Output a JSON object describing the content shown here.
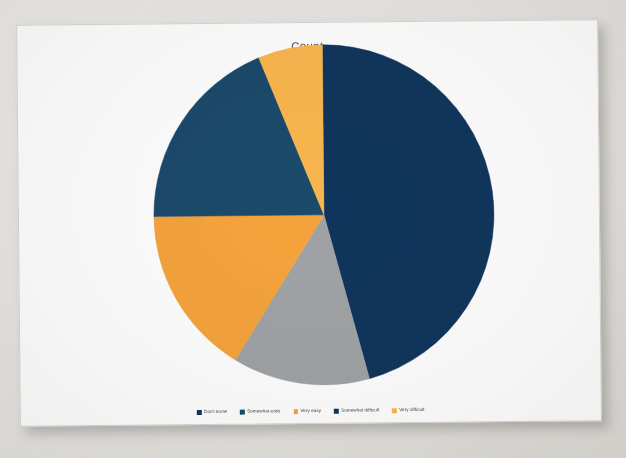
{
  "chart": {
    "title": "Count"
  },
  "legend": {
    "items": [
      {
        "label": "Don't know",
        "color": "#10355c"
      },
      {
        "label": "Somewhat easy",
        "color": "#1b4a6b"
      },
      {
        "label": "Very easy",
        "color": "#f5a33c"
      },
      {
        "label": "Somewhat difficult",
        "color": "#10355c"
      },
      {
        "label": "Very difficult",
        "color": "#f9b64e"
      }
    ]
  },
  "chart_data": {
    "type": "pie",
    "title": "Count",
    "xlabel": "",
    "ylabel": "",
    "legend_position": "bottom",
    "grid": false,
    "start_angle_deg": 0,
    "direction": "clockwise",
    "categories": [
      "Don't know",
      "Somewhat easy",
      "Very easy",
      "Somewhat difficult",
      "Very difficult"
    ],
    "values": [
      46,
      13,
      16,
      19,
      6
    ],
    "units": "percent",
    "slices": [
      {
        "label": "Don't know",
        "value": 46,
        "color": "#10355c",
        "start_deg": 0,
        "end_deg": 165
      },
      {
        "label": "Somewhat easy",
        "value": 13,
        "color": "#a0a3a5",
        "start_deg": 165,
        "end_deg": 212
      },
      {
        "label": "Very easy",
        "value": 16,
        "color": "#f5a33c",
        "start_deg": 212,
        "end_deg": 270
      },
      {
        "label": "Somewhat difficult",
        "value": 19,
        "color": "#1b4a6b",
        "start_deg": 270,
        "end_deg": 338
      },
      {
        "label": "Very difficult",
        "value": 6,
        "color": "#f9b64e",
        "start_deg": 338,
        "end_deg": 360
      }
    ]
  }
}
